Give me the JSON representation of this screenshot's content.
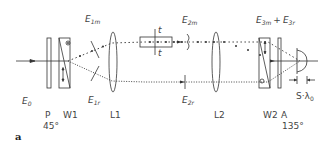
{
  "figure": {
    "panel_label": "a",
    "components": {
      "polarizer": {
        "label": "P",
        "angle": "45°"
      },
      "wollaston1": {
        "label": "W1"
      },
      "lens1": {
        "label": "L1"
      },
      "lens2": {
        "label": "L2"
      },
      "wollaston2": {
        "label": "W2"
      },
      "analyzer": {
        "label": "A",
        "angle": "135°"
      }
    },
    "fields": {
      "e0": {
        "base": "E",
        "sub": "0"
      },
      "e1m": {
        "base": "E",
        "sub": "1m"
      },
      "e1r": {
        "base": "E",
        "sub": "1r"
      },
      "e2m": {
        "base": "E",
        "sub": "2m"
      },
      "e2r": {
        "base": "E",
        "sub": "2r"
      },
      "e3m": {
        "base": "E",
        "sub": "3m"
      },
      "plus": "+",
      "e3r": {
        "base": "E",
        "sub": "3r"
      }
    },
    "sample_marker": {
      "t_top": "t",
      "t_bottom": "t"
    },
    "shift_label": {
      "prefix": "S·λ",
      "sub": "0"
    },
    "colors": {
      "line": "#333333",
      "text": "#444444"
    }
  }
}
